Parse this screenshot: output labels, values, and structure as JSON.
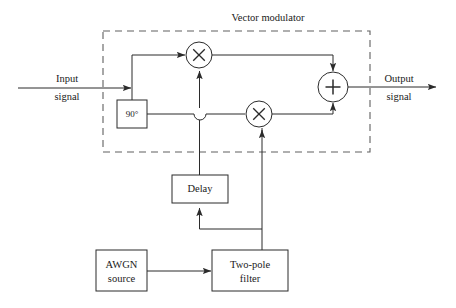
{
  "diagram": {
    "title": "Vector modulator",
    "type": "block-diagram",
    "stroke_color": "#2b2b2b",
    "dashed_color": "#555555",
    "background": "#ffffff",
    "labels": {
      "input_line1": "Input",
      "input_line2": "signal",
      "output_line1": "Output",
      "output_line2": "signal",
      "phase_shifter": "90°",
      "delay": "Delay",
      "awgn_line1": "AWGN",
      "awgn_line2": "source",
      "filter_line1": "Two-pole",
      "filter_line2": "filter",
      "multiplier_symbol": "×",
      "summer_symbol": "+"
    },
    "blocks": [
      {
        "id": "phase-shifter",
        "label": "90°",
        "x": 117,
        "y": 100,
        "w": 30,
        "h": 28
      },
      {
        "id": "delay",
        "label": "Delay",
        "x": 172,
        "y": 175,
        "w": 56,
        "h": 28
      },
      {
        "id": "awgn-source",
        "label": "AWGN source",
        "x": 96,
        "y": 250,
        "w": 51,
        "h": 41
      },
      {
        "id": "two-pole-filter",
        "label": "Two-pole filter",
        "x": 212,
        "y": 250,
        "w": 76,
        "h": 41
      }
    ],
    "operators": [
      {
        "id": "multiplier-i",
        "symbol": "×",
        "cx": 199,
        "cy": 55,
        "r": 13
      },
      {
        "id": "multiplier-q",
        "symbol": "×",
        "cx": 259,
        "cy": 114,
        "r": 13
      },
      {
        "id": "summer",
        "symbol": "+",
        "cx": 333,
        "cy": 87,
        "r": 15
      }
    ],
    "enclosure": {
      "id": "vector-modulator-boundary",
      "x": 103,
      "y": 31,
      "w": 267,
      "h": 121,
      "style": "dashed"
    }
  }
}
